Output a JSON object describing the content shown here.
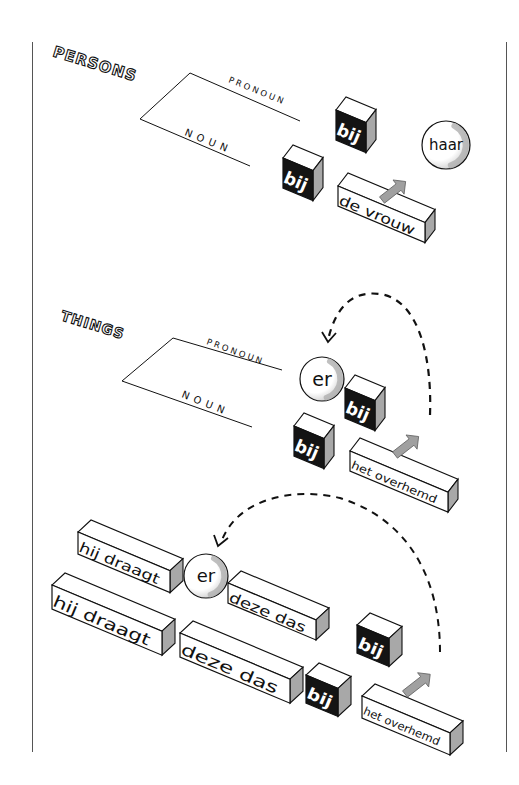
{
  "sections": {
    "persons": {
      "title": "PERSONS",
      "pronoun_label": "PRONOUN",
      "noun_label": "NOUN"
    },
    "things": {
      "title": "THINGS",
      "pronoun_label": "PRONOUN",
      "noun_label": "NOUN"
    }
  },
  "blocks": [
    {
      "id": "p-bij-pronoun",
      "label": "bij",
      "style": "dark",
      "x": 336,
      "y": 110,
      "w": 30,
      "h": 30,
      "slope": 0.42,
      "dx": 10,
      "dy": -13,
      "fs": 17
    },
    {
      "id": "p-bij-noun",
      "label": "bij",
      "style": "dark",
      "x": 283,
      "y": 158,
      "w": 30,
      "h": 30,
      "slope": 0.42,
      "dx": 10,
      "dy": -13,
      "fs": 17
    },
    {
      "id": "p-de-vrouw",
      "label": "de vrouw",
      "style": "light",
      "x": 338,
      "y": 186,
      "w": 87,
      "h": 20,
      "slope": 0.42,
      "dx": 10,
      "dy": -13,
      "fs": 14
    },
    {
      "id": "t-bij-pronoun",
      "label": "bij",
      "style": "dark",
      "x": 345,
      "y": 388,
      "w": 30,
      "h": 30,
      "slope": 0.42,
      "dx": 10,
      "dy": -13,
      "fs": 17
    },
    {
      "id": "t-bij-noun",
      "label": "bij",
      "style": "dark",
      "x": 294,
      "y": 426,
      "w": 30,
      "h": 30,
      "slope": 0.42,
      "dx": 10,
      "dy": -13,
      "fs": 17
    },
    {
      "id": "t-het-overhemd",
      "label": "het overhemd",
      "style": "light",
      "x": 350,
      "y": 451,
      "w": 98,
      "h": 20,
      "slope": 0.42,
      "dx": 10,
      "dy": -13,
      "fs": 11
    },
    {
      "id": "s-hij-draagt-top",
      "label": "hij draagt",
      "style": "light",
      "x": 78,
      "y": 532,
      "w": 92,
      "h": 22,
      "slope": 0.42,
      "dx": 13,
      "dy": -12,
      "fs": 14
    },
    {
      "id": "s-deze-das-top",
      "label": "deze das",
      "style": "light",
      "x": 228,
      "y": 583,
      "w": 88,
      "h": 20,
      "slope": 0.42,
      "dx": 13,
      "dy": -12,
      "fs": 14
    },
    {
      "id": "s-hij-draagt-bottom",
      "label": "hij draagt",
      "style": "light",
      "x": 52,
      "y": 585,
      "w": 110,
      "h": 24,
      "slope": 0.42,
      "dx": 13,
      "dy": -12,
      "fs": 16
    },
    {
      "id": "s-deze-das-bottom",
      "label": "deze das",
      "style": "light",
      "x": 180,
      "y": 633,
      "w": 110,
      "h": 24,
      "slope": 0.42,
      "dx": 13,
      "dy": -12,
      "fs": 16
    },
    {
      "id": "s-bij-pronoun",
      "label": "bij",
      "style": "dark",
      "x": 357,
      "y": 625,
      "w": 32,
      "h": 28,
      "slope": 0.42,
      "dx": 13,
      "dy": -12,
      "fs": 16
    },
    {
      "id": "s-bij-noun",
      "label": "bij",
      "style": "dark",
      "x": 306,
      "y": 675,
      "w": 32,
      "h": 28,
      "slope": 0.42,
      "dx": 13,
      "dy": -12,
      "fs": 16
    },
    {
      "id": "s-het-overhemd",
      "label": "het overhemd",
      "style": "light",
      "x": 362,
      "y": 696,
      "w": 88,
      "h": 22,
      "slope": 0.42,
      "dx": 13,
      "dy": -12,
      "fs": 11
    }
  ],
  "spheres": [
    {
      "id": "p-haar",
      "label": "haar",
      "cx": 446,
      "cy": 145,
      "r": 24,
      "fs": 15
    },
    {
      "id": "t-er",
      "label": "er",
      "cx": 322,
      "cy": 379,
      "r": 22,
      "fs": 19
    },
    {
      "id": "s-er",
      "label": "er",
      "cx": 206,
      "cy": 576,
      "r": 22,
      "fs": 18
    }
  ],
  "colors": {
    "ink": "#111111",
    "dark_face": "#141414",
    "side_face": "#a8a8a8",
    "top_face": "#ffffff",
    "arrow_fill": "#a0a0a0",
    "frame": "#555555"
  }
}
